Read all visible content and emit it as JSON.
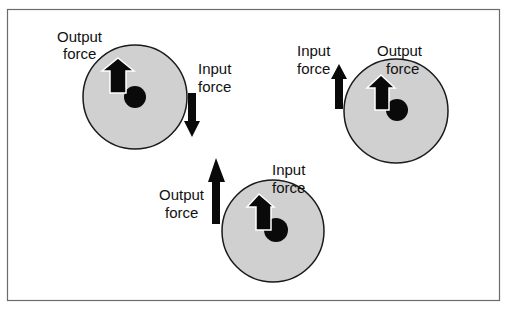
{
  "colors": {
    "frame": "#6b6b6b",
    "wheel_fill": "#d0d0d0",
    "wheel_stroke": "#1a1a1a",
    "ink": "#0a0a0a",
    "outline": "#ffffff"
  },
  "labels": {
    "output_line1": "Output",
    "input_line1": "Input",
    "force_line2": "force"
  },
  "diagrams": [
    {
      "id": "wheel-top-left",
      "top_label": {
        "line1": "Output",
        "line2": "force"
      },
      "side_label": {
        "line1": "Input",
        "line2": "force"
      },
      "input_direction": "down",
      "output_direction": "up"
    },
    {
      "id": "wheel-top-right",
      "top_label": {
        "line1": "Output",
        "line2": "force"
      },
      "side_label": {
        "line1": "Input",
        "line2": "force"
      },
      "input_direction": "up",
      "output_direction": "up"
    },
    {
      "id": "wheel-bottom-center",
      "top_label": {
        "line1": "Input",
        "line2": "force"
      },
      "side_label": {
        "line1": "Output",
        "line2": "force"
      },
      "input_direction": "up",
      "output_direction": "up"
    }
  ]
}
